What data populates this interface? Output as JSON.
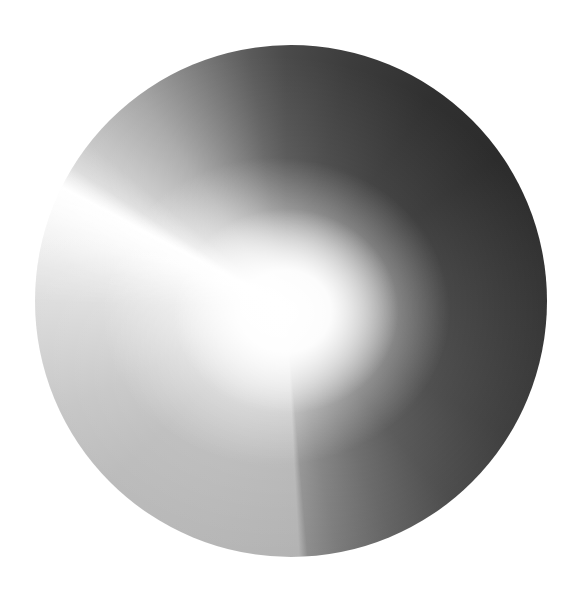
{
  "canvas": {
    "width": 579,
    "height": 589,
    "background": "#ffffff"
  },
  "disc": {
    "shape": "circle",
    "center": [
      291,
      301
    ],
    "radius": 256,
    "fill": "angular-grayscale-gradient",
    "highlight_center": [
      285,
      310
    ],
    "colors": {
      "top": "#4a4a4a",
      "upper_right": "#2e2e2e",
      "right": "#383838",
      "lower_right": "#4c4c4c",
      "bottom": "#b2b2b2",
      "lower_left": "#b9b9b9",
      "left": "#d6d6d6",
      "upper_left_beam": "#ffffff",
      "highlight": "#ffffff"
    }
  }
}
